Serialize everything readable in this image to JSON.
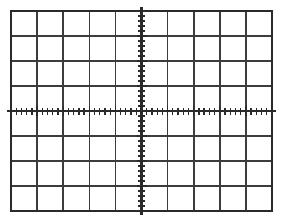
{
  "app": {
    "title": "Oscilloscope Graticule",
    "kind": "oscilloscope-screen"
  },
  "graticule": {
    "label": "oscilloscope graticule",
    "background_color": "#ffffff",
    "grid_color": "#3c3c3c",
    "border_color": "#2a2a2a",
    "axis_color": "#2a2a2a",
    "tick_color": "#2a2a2a",
    "horizontal_divisions": 10,
    "vertical_divisions": 8,
    "subdivisions_per_division": 5,
    "grid_line_width": 1.6,
    "border_line_width": 2.2,
    "axis_line_width": 2.2,
    "tick_line_width": 1.3,
    "minor_tick_length": 7,
    "area": {
      "left": 11,
      "top": 11,
      "right": 272,
      "bottom": 211,
      "width": 261,
      "height": 200
    },
    "division_size": {
      "x": 26.1,
      "y": 25.0
    },
    "center": {
      "x": 141.5,
      "y": 111
    },
    "axis_overshoot": 4
  },
  "chart_data": {
    "type": "grid",
    "title": "",
    "xlabel": "",
    "ylabel": "",
    "xlim": [
      -5,
      5
    ],
    "ylim": [
      -4,
      4
    ],
    "xticks": [
      -5,
      -4,
      -3,
      -2,
      -1,
      0,
      1,
      2,
      3,
      4,
      5
    ],
    "yticks": [
      -4,
      -3,
      -2,
      -1,
      0,
      1,
      2,
      3,
      4
    ],
    "grid": true,
    "legend": "none",
    "series": [],
    "annotations": []
  }
}
